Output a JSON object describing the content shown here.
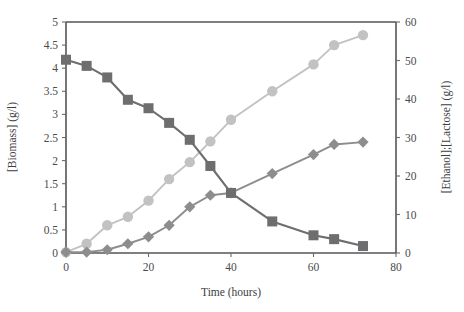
{
  "chart_data": {
    "type": "line",
    "title": "",
    "xlabel": "Time (hours)",
    "ylabel_left": "[Biomass] (g/l)",
    "ylabel_right": "[Ethanol];[Lactose] (g/l)",
    "xlim": [
      0,
      80
    ],
    "ylim_left": [
      0,
      5
    ],
    "ylim_right": [
      0,
      60
    ],
    "xticks": [
      0,
      20,
      40,
      60,
      80
    ],
    "xticklabels": [
      "0",
      "20",
      "40",
      "60",
      "80"
    ],
    "yticks_left": [
      0,
      0.5,
      1,
      1.5,
      2,
      2.5,
      3,
      3.5,
      4,
      4.5,
      5
    ],
    "yticklabels_left": [
      "0",
      "0.5",
      "1",
      "1.5",
      "2",
      "2.5",
      "3",
      "3.5",
      "4",
      "4.5",
      "5"
    ],
    "yticks_right": [
      0,
      10,
      20,
      30,
      40,
      50,
      60
    ],
    "yticklabels_right": [
      "0",
      "10",
      "20",
      "30",
      "40",
      "50",
      "60"
    ],
    "grid": false,
    "legend": "none",
    "series": [
      {
        "name": "Lactose",
        "axis": "right",
        "marker": "square",
        "color": "#6e6d6f",
        "x": [
          0,
          5,
          10,
          15,
          20,
          25,
          30,
          35,
          40,
          50,
          60,
          65,
          72
        ],
        "values_left_scale": [
          4.18,
          4.05,
          3.8,
          3.32,
          3.13,
          2.82,
          2.45,
          1.88,
          1.3,
          0.68,
          0.38,
          0.3,
          0.15
        ],
        "values": [
          50.2,
          48.6,
          45.6,
          39.8,
          37.6,
          33.8,
          29.4,
          22.6,
          15.6,
          8.2,
          4.6,
          3.6,
          1.8
        ]
      },
      {
        "name": "Ethanol",
        "axis": "right",
        "marker": "circle",
        "color": "#c3c2c3",
        "x": [
          0,
          5,
          10,
          15,
          20,
          25,
          30,
          35,
          40,
          50,
          60,
          65,
          72
        ],
        "values_left_scale": [
          0.02,
          0.2,
          0.6,
          0.78,
          1.13,
          1.6,
          1.97,
          2.42,
          2.88,
          3.5,
          4.08,
          4.5,
          4.72
        ],
        "values": [
          0.2,
          2.4,
          7.2,
          9.4,
          13.6,
          19.2,
          23.6,
          29.0,
          34.6,
          42.0,
          49.0,
          54.0,
          56.6
        ]
      },
      {
        "name": "Biomass",
        "axis": "left",
        "marker": "diamond",
        "color": "#8d8c8e",
        "x": [
          0,
          5,
          10,
          15,
          20,
          25,
          30,
          35,
          40,
          50,
          60,
          65,
          72
        ],
        "values": [
          0.02,
          0.02,
          0.07,
          0.2,
          0.35,
          0.6,
          1.0,
          1.25,
          1.3,
          1.72,
          2.13,
          2.35,
          2.4
        ]
      }
    ]
  },
  "colors": {
    "axis": "#555456",
    "tick_text": "#4a4a4c",
    "lactose": "#6e6d6f",
    "ethanol": "#c3c2c3",
    "biomass": "#8d8c8e",
    "background": "#ffffff"
  }
}
